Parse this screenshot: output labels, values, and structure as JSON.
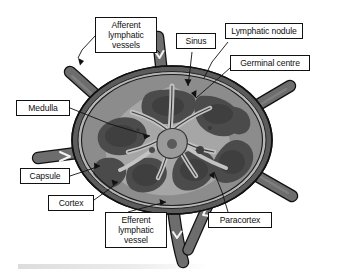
{
  "figure": {
    "colors": {
      "capsule": "#4c4c4c",
      "cortex": "#7e7e7e",
      "nodule": "#4f4f4f",
      "sinus": "#b4b4b4",
      "medulla": "#9e9e9e",
      "vessel": "#6d6d6d",
      "outline": "#111111",
      "label_background": "#ffffff"
    }
  },
  "labels": {
    "afferent": "Afferent\nlymphatic\nvessels",
    "sinus": "Sinus",
    "nodule": "Lymphatic nodule",
    "germinal": "Germinal centre",
    "medulla": "Medulla",
    "capsule": "Capsule",
    "cortex": "Cortex",
    "efferent": "Efferent\nlymphatic\nvessel",
    "paracortex": "Paracortex"
  }
}
